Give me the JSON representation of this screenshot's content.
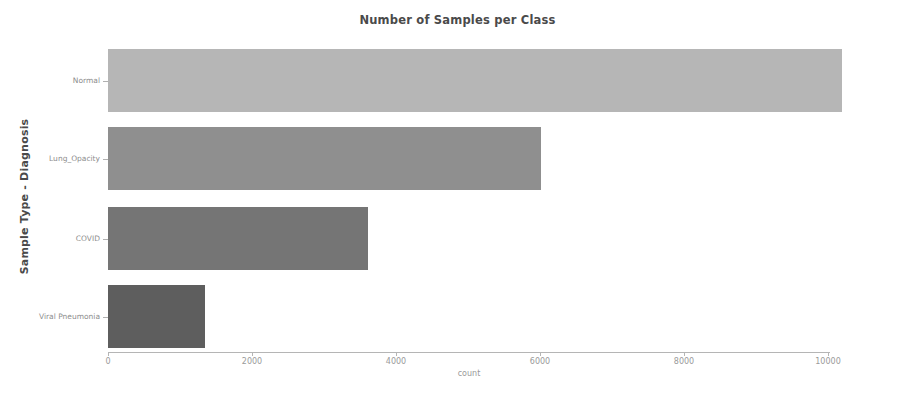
{
  "chart_data": {
    "type": "bar",
    "orientation": "horizontal",
    "title": "Number of Samples per Class",
    "xlabel": "count",
    "ylabel": "Sample Type - Diagnosis",
    "categories": [
      "Normal",
      "Lung_Opacity",
      "COVID",
      "Viral Pneumonia"
    ],
    "values": [
      10192,
      6012,
      3616,
      1345
    ],
    "bar_colors": [
      "#b6b6b6",
      "#8f8f8f",
      "#757575",
      "#5e5e5e"
    ],
    "xlim": [
      0,
      10600
    ],
    "ylim_categories": 4,
    "xticks": [
      0,
      2000,
      4000,
      6000,
      8000,
      10000
    ],
    "xtick_labels": [
      "0",
      "2000",
      "4000",
      "6000",
      "8000",
      "10000"
    ],
    "grid": false,
    "legend": false,
    "series": [
      {
        "name": "count",
        "values": [
          10192,
          6012,
          3616,
          1345
        ]
      }
    ]
  },
  "figure": {
    "background_color": "#ffffff",
    "title_color": "#4a4a4a",
    "axis_label_color": "#9a9a9a",
    "tick_label_color": "#8d8d8d",
    "axis_line_color": "#b5b5b5"
  }
}
